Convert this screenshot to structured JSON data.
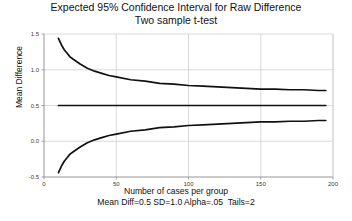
{
  "chart_data": {
    "type": "line",
    "title": "Expected 95% Confidence Interval for Raw Difference",
    "subtitle": "Two sample t-test",
    "xlabel": "Number of cases per group",
    "ylabel": "Mean Difference",
    "note": "Mean Diff=0.5 SD=1.0 Alpha=.05  Tails=2",
    "xlim": [
      0,
      200
    ],
    "ylim": [
      -0.5,
      1.5
    ],
    "xticks": [
      0,
      50,
      100,
      150,
      200
    ],
    "xticklabels": [
      "0",
      "50",
      "100",
      "150",
      "200"
    ],
    "yticks": [
      -0.5,
      0.0,
      0.5,
      1.0,
      1.5
    ],
    "yticklabels": [
      "-0.5",
      "0.0",
      "0.5",
      "1.0",
      "1.5"
    ],
    "grid": true,
    "legend": "none",
    "parameters": {
      "mean_difference": 0.5,
      "sd": 1.0,
      "alpha": 0.05,
      "tails": 2,
      "confidence_level": "95%"
    },
    "x": [
      10,
      12,
      14,
      16,
      18,
      20,
      25,
      30,
      35,
      40,
      45,
      50,
      60,
      70,
      80,
      90,
      100,
      110,
      120,
      130,
      140,
      150,
      160,
      170,
      180,
      190,
      195
    ],
    "series": [
      {
        "name": "Upper confidence limit",
        "values": [
          1.44,
          1.35,
          1.28,
          1.23,
          1.18,
          1.15,
          1.08,
          1.02,
          0.98,
          0.95,
          0.92,
          0.9,
          0.86,
          0.84,
          0.81,
          0.8,
          0.78,
          0.77,
          0.76,
          0.75,
          0.74,
          0.73,
          0.73,
          0.72,
          0.72,
          0.71,
          0.71
        ]
      },
      {
        "name": "Mean difference",
        "values": [
          0.5,
          0.5,
          0.5,
          0.5,
          0.5,
          0.5,
          0.5,
          0.5,
          0.5,
          0.5,
          0.5,
          0.5,
          0.5,
          0.5,
          0.5,
          0.5,
          0.5,
          0.5,
          0.5,
          0.5,
          0.5,
          0.5,
          0.5,
          0.5,
          0.5,
          0.5,
          0.5
        ]
      },
      {
        "name": "Lower confidence limit",
        "values": [
          -0.44,
          -0.35,
          -0.28,
          -0.23,
          -0.18,
          -0.15,
          -0.08,
          -0.02,
          0.02,
          0.05,
          0.08,
          0.1,
          0.14,
          0.16,
          0.19,
          0.2,
          0.22,
          0.23,
          0.24,
          0.25,
          0.26,
          0.27,
          0.27,
          0.28,
          0.28,
          0.29,
          0.29
        ]
      }
    ],
    "colors": {
      "line": "#111111",
      "grid": "#c8c8c8",
      "axis": "#8a8a8a",
      "background": "#ffffff"
    }
  }
}
